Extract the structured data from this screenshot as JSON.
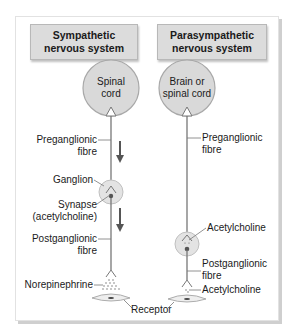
{
  "sympathetic": {
    "title_line1": "Sympathetic",
    "title_line2": "nervous system",
    "origin_line1": "Spinal",
    "origin_line2": "cord",
    "preganglionic_line1": "Preganglionic",
    "preganglionic_line2": "fibre",
    "ganglion": "Ganglion",
    "synapse_line1": "Synapse",
    "synapse_line2": "(acetylcholine)",
    "postganglionic_line1": "Postganglionic",
    "postganglionic_line2": "fibre",
    "neurotransmitter": "Norepinephrine"
  },
  "parasympathetic": {
    "title_line1": "Parasympathetic",
    "title_line2": "nervous system",
    "origin_line1": "Brain or",
    "origin_line2": "spinal cord",
    "preganglionic_line1": "Preganglionic",
    "preganglionic_line2": "fibre",
    "ganglion_neurotransmitter": "Acetylcholine",
    "postganglionic_line1": "Postganglionic",
    "postganglionic_line2": "fibre",
    "neurotransmitter": "Acetylcholine"
  },
  "receptor_label": "Receptor",
  "colors": {
    "title_fill": "#dcdcdc",
    "circle_fill": "#d9d9d9",
    "circle_stroke": "#a8a8a8",
    "fibre": "#777777",
    "arrow": "#555555"
  }
}
